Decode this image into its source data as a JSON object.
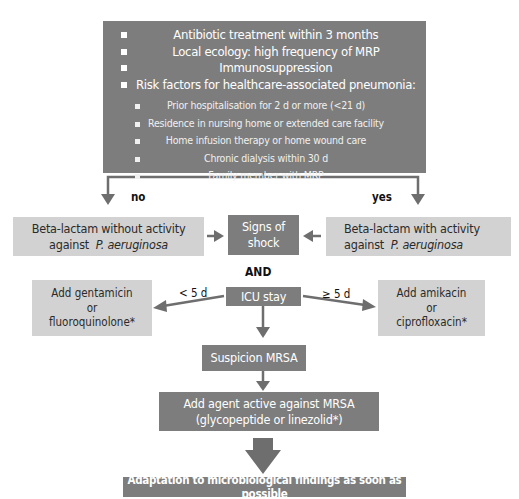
{
  "top_box": {
    "criteria": [
      "Antibiotic treatment within 3 months",
      "Local ecology: high frequency of MRP",
      "Immunosuppression",
      "Risk factors for healthcare-associated pneumonia:"
    ],
    "sub_criteria": [
      "Prior hospitalisation for 2 d or more (<21 d)",
      "Residence in nursing home or extended care facility",
      "Home infusion therapy or home wound care",
      "Chronic dialysis within 30 d",
      "Family member with MRP"
    ]
  },
  "branches": {
    "no": "no",
    "yes": "yes"
  },
  "left_box": {
    "line1": "Beta-lactam without activity",
    "line2_prefix": "against",
    "line2_italic": "P. aeruginosa"
  },
  "right_box": {
    "line1": "Beta-lactam with activity",
    "line2_prefix": "against",
    "line2_italic": "P. aeruginosa"
  },
  "shock_box": {
    "line1": "Signs of",
    "line2": "shock"
  },
  "and_label": "AND",
  "icu_box": {
    "label": "ICU stay"
  },
  "icu_branches": {
    "left": "< 5 d",
    "right": "≥ 5 d"
  },
  "left_add_box": {
    "line1": "Add gentamicin",
    "line2": "or",
    "line3": "fluoroquinolone*"
  },
  "right_add_box": {
    "line1": "Add amikacin",
    "line2": "or",
    "line3": "ciprofloxacin*"
  },
  "mrsa_box": {
    "label": "Suspicion MRSA"
  },
  "mrsa_agent_box": {
    "line1": "Add agent active against MRSA",
    "line2": "(glycopeptide or linezolid*)"
  },
  "final_box": {
    "label": "Adaptation to microbiological findings as soon as possible"
  },
  "colors": {
    "dark_box": "#7d7d7d",
    "light_box": "#d2d2d2",
    "arrow": "#6e6e6e"
  }
}
